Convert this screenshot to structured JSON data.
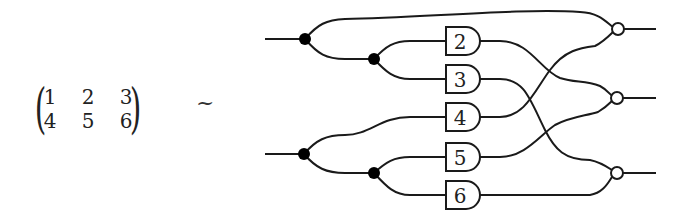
{
  "matrix": {
    "rows": [
      [
        "1",
        "2",
        "3"
      ],
      [
        "4",
        "5",
        "6"
      ]
    ],
    "left_bracket": "(",
    "right_bracket": ")"
  },
  "relation_symbol": "~",
  "circuit": {
    "inputs": [
      {
        "id": "in1",
        "y": 39
      },
      {
        "id": "in2",
        "y": 154
      }
    ],
    "split_nodes": [
      {
        "id": "s1",
        "x": 305,
        "y": 39
      },
      {
        "id": "s2",
        "x": 374,
        "y": 59
      },
      {
        "id": "s3",
        "x": 304,
        "y": 154
      },
      {
        "id": "s4",
        "x": 374,
        "y": 173
      }
    ],
    "gates": [
      {
        "label": "2",
        "y": 41
      },
      {
        "label": "3",
        "y": 79
      },
      {
        "label": "4",
        "y": 117
      },
      {
        "label": "5",
        "y": 157
      },
      {
        "label": "6",
        "y": 195
      }
    ],
    "outputs": [
      {
        "id": "out1",
        "y": 29,
        "inputs": [
          "s1-direct",
          "4"
        ]
      },
      {
        "id": "out2",
        "y": 98,
        "inputs": [
          "2",
          "5"
        ]
      },
      {
        "id": "out3",
        "y": 173,
        "inputs": [
          "3",
          "6"
        ]
      }
    ],
    "colors": {
      "stroke": "#1a1a1a",
      "node_fill": "#000000",
      "output_fill": "#ffffff"
    }
  }
}
